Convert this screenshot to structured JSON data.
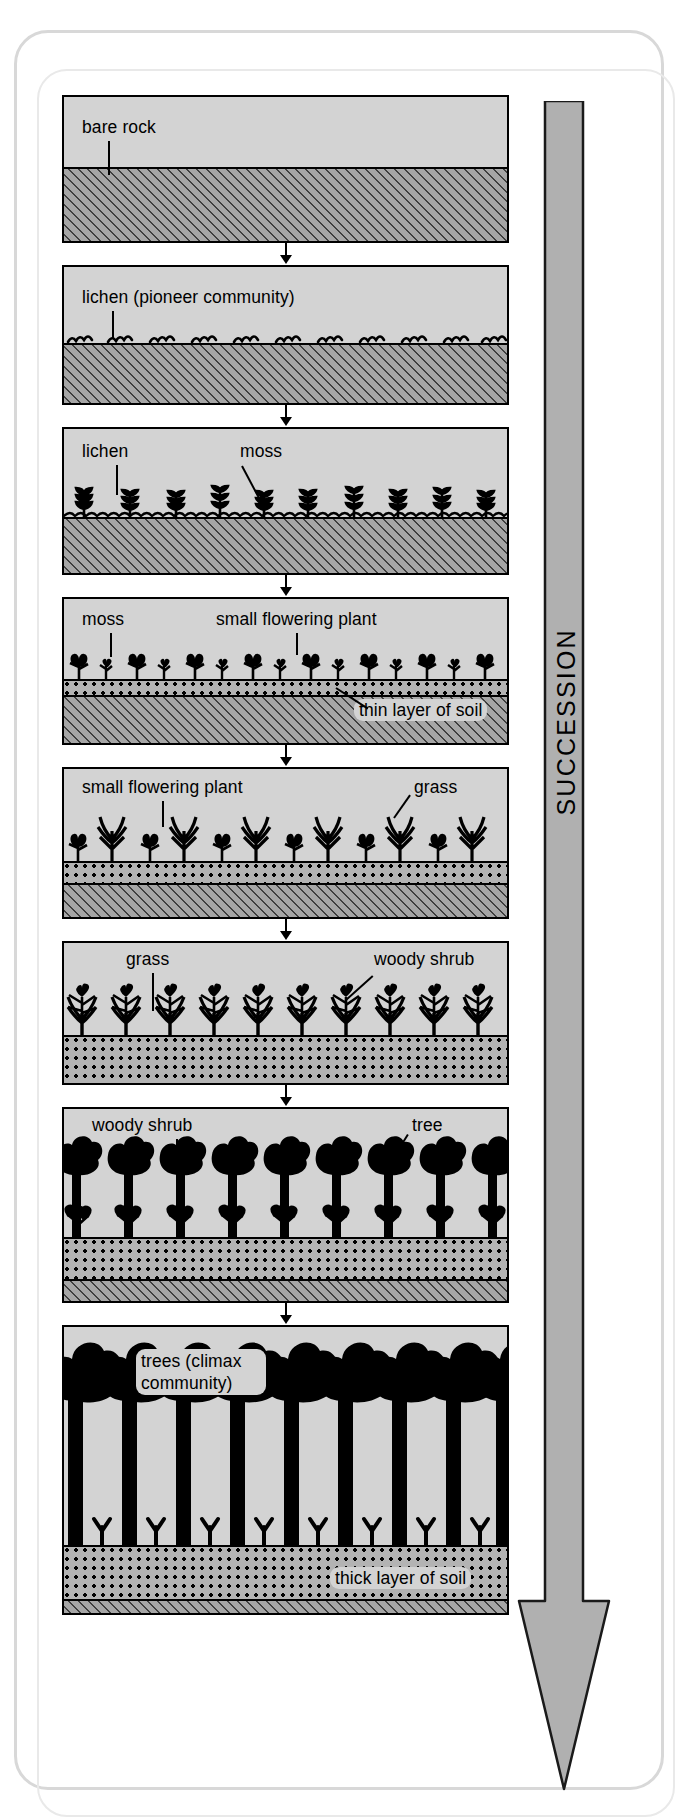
{
  "diagram": {
    "succession_arrow_label": "SUCCESSION",
    "colors": {
      "sky": "#d3d3d3",
      "rock_hatch": "#a6a6a6",
      "soil_dots": "#b3b3b3",
      "vegetation": "#000000",
      "arrow": "#b0b0b0",
      "outline": "#000000"
    },
    "stages": [
      {
        "index": 1,
        "name": "bare-rock",
        "labels": [
          {
            "text": "bare rock",
            "leader": "vertical"
          }
        ]
      },
      {
        "index": 2,
        "name": "lichen-pioneer",
        "labels": [
          {
            "text": "lichen (pioneer community)",
            "leader": "vertical"
          }
        ]
      },
      {
        "index": 3,
        "name": "lichen-and-moss",
        "labels": [
          {
            "text": "lichen",
            "leader": "vertical"
          },
          {
            "text": "moss",
            "leader": "diagonal"
          }
        ]
      },
      {
        "index": 4,
        "name": "moss-and-small-flowering-plant",
        "labels": [
          {
            "text": "moss",
            "leader": "vertical"
          },
          {
            "text": "small flowering plant",
            "leader": "vertical"
          },
          {
            "text": "thin layer of soil",
            "leader": "diagonal"
          }
        ]
      },
      {
        "index": 5,
        "name": "flowering-plants-and-grass",
        "labels": [
          {
            "text": "small flowering plant",
            "leader": "vertical"
          },
          {
            "text": "grass",
            "leader": "diagonal"
          }
        ]
      },
      {
        "index": 6,
        "name": "grass-and-woody-shrub",
        "labels": [
          {
            "text": "grass",
            "leader": "vertical"
          },
          {
            "text": "woody shrub",
            "leader": "diagonal"
          }
        ]
      },
      {
        "index": 7,
        "name": "woody-shrub-and-tree",
        "labels": [
          {
            "text": "woody shrub",
            "leader": "vertical"
          },
          {
            "text": "tree",
            "leader": "diagonal"
          }
        ]
      },
      {
        "index": 8,
        "name": "climax-community",
        "labels": [
          {
            "text": "trees (climax\ncommunity)",
            "leader": "none"
          },
          {
            "text": "thick layer of soil",
            "leader": "none"
          }
        ]
      }
    ]
  }
}
